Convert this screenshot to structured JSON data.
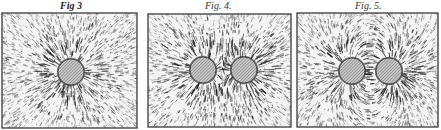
{
  "plate": {
    "description": "Iron filings field-line illustrations",
    "figures": [
      {
        "id": "fig3",
        "caption": "Fig 3",
        "frame": {
          "x": 2,
          "y": 13,
          "w": 135,
          "h": 115
        },
        "poles": [
          {
            "cx": 71,
            "cy": 72,
            "r": 13
          }
        ],
        "pattern": "single-radial"
      },
      {
        "id": "fig4",
        "caption": "Fig. 4.",
        "frame": {
          "x": 148,
          "y": 14,
          "w": 143,
          "h": 113
        },
        "poles": [
          {
            "cx": 203,
            "cy": 70,
            "r": 13
          },
          {
            "cx": 244,
            "cy": 70,
            "r": 13
          }
        ],
        "pattern": "like-poles-repel"
      },
      {
        "id": "fig5",
        "caption": "Fig. 5.",
        "frame": {
          "x": 297,
          "y": 13,
          "w": 141,
          "h": 114
        },
        "poles": [
          {
            "cx": 352,
            "cy": 71,
            "r": 13
          },
          {
            "cx": 389,
            "cy": 71,
            "r": 13
          }
        ],
        "pattern": "unlike-poles-attract"
      }
    ]
  },
  "colors": {
    "ink": "#1a1a1a",
    "paper": "#ffffff",
    "frame": "#444444",
    "hatch": "#888888"
  }
}
